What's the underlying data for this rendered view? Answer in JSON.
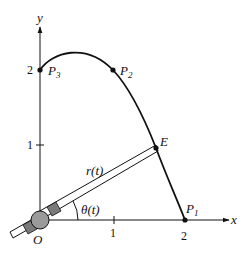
{
  "axes": {
    "x_label": "x",
    "y_label": "y",
    "origin_label": "O",
    "x_ticks": [
      {
        "value": 1,
        "label": "1"
      },
      {
        "value": 2,
        "label": "2"
      }
    ],
    "y_ticks": [
      {
        "value": 1,
        "label": "1"
      },
      {
        "value": 2,
        "label": "2"
      }
    ]
  },
  "points": {
    "p1": {
      "name": "P",
      "sub": "1",
      "coords": [
        2,
        0
      ]
    },
    "p2": {
      "name": "P",
      "sub": "2",
      "coords": [
        1,
        2
      ]
    },
    "p3": {
      "name": "P",
      "sub": "3",
      "coords": [
        0,
        2
      ]
    },
    "e": {
      "name": "E"
    }
  },
  "arm": {
    "length_label": "r(t)",
    "angle_label": "θ(t)"
  },
  "colors": {
    "line": "#111111",
    "joint_fill": "#9a9a9a",
    "clamp_fill": "#7a7a7a"
  }
}
